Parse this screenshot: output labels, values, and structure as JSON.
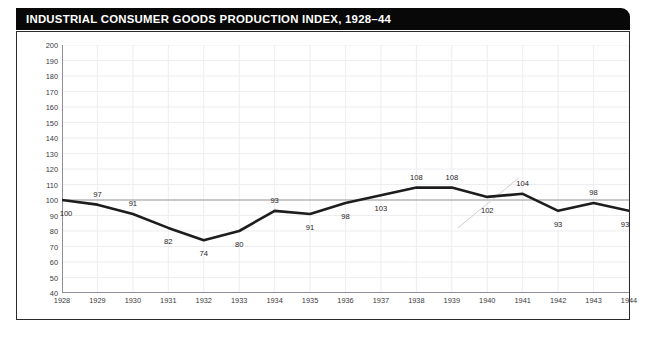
{
  "title": "INDUSTRIAL CONSUMER GOODS PRODUCTION INDEX, 1928–44",
  "chart_data": {
    "type": "line",
    "title": "INDUSTRIAL CONSUMER GOODS PRODUCTION INDEX, 1928–44",
    "xlabel": "",
    "ylabel": "",
    "categories": [
      "1928",
      "1929",
      "1930",
      "1931",
      "1932",
      "1933",
      "1934",
      "1935",
      "1936",
      "1937",
      "1938",
      "1939",
      "1940",
      "1941",
      "1942",
      "1943",
      "1944"
    ],
    "x": [
      1928,
      1929,
      1930,
      1931,
      1932,
      1933,
      1934,
      1935,
      1936,
      1937,
      1938,
      1939,
      1940,
      1941,
      1942,
      1943,
      1944
    ],
    "values": [
      100,
      97,
      91,
      82,
      74,
      80,
      93,
      91,
      98,
      103,
      108,
      108,
      102,
      104,
      93,
      98,
      93
    ],
    "series": [
      {
        "name": "Industrial consumer goods production index",
        "values": [
          100,
          97,
          91,
          82,
          74,
          80,
          93,
          91,
          98,
          103,
          108,
          108,
          102,
          104,
          93,
          98,
          93
        ],
        "color": "#1d1d1d"
      }
    ],
    "point_labels": [
      "100",
      "97",
      "91",
      "82",
      "74",
      "80",
      "93",
      "91",
      "98",
      "103",
      "108",
      "108",
      "102",
      "104",
      "93",
      "98",
      "93"
    ],
    "label_side": [
      "below",
      "above",
      "above",
      "below",
      "below",
      "below",
      "above",
      "below",
      "below",
      "below",
      "above",
      "above",
      "below",
      "above",
      "below",
      "above",
      "below"
    ],
    "ylim": [
      40,
      200
    ],
    "ytick_step": 10,
    "yticks": [
      200,
      190,
      180,
      170,
      160,
      150,
      140,
      130,
      120,
      110,
      100,
      90,
      80,
      70,
      60,
      50,
      40
    ],
    "xlim": [
      1928,
      1944
    ],
    "grid": true,
    "grid_color": "#ededf2",
    "reference_line": {
      "value": 100,
      "color": "#9a9a9a",
      "label": ""
    },
    "legend": "none",
    "line_color": "#1d1d1d",
    "line_width": 2.6,
    "background": "#ffffff"
  },
  "colors": {
    "title_bar_background": "#080808",
    "title_text": "#ffffff",
    "frame_border": "#2b2b2b",
    "axis_line": "#8f8f97",
    "gridline": "#ededf2",
    "tick_text": "#3a3a3a",
    "data_line": "#1d1d1d",
    "reference_line": "#9a9a9a",
    "plot_background": "#ffffff"
  }
}
